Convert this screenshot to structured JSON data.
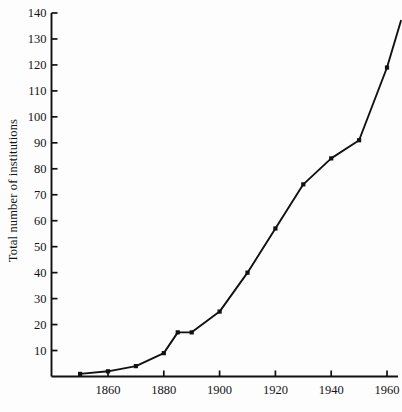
{
  "figure": {
    "background_color": "#fdfdfd",
    "ink_color": "#111111"
  },
  "axes": {
    "ylabel": "Total number of institutions",
    "xlabel": "",
    "y_ticks": [
      10,
      20,
      30,
      40,
      50,
      60,
      70,
      80,
      90,
      100,
      110,
      120,
      130,
      140
    ],
    "y_tick_labels": [
      "10",
      "20",
      "30",
      "40",
      "50",
      "60",
      "70",
      "80",
      "90",
      "100",
      "110",
      "120",
      "130",
      "140"
    ],
    "x_ticks": [
      1860,
      1880,
      1900,
      1920,
      1940,
      1960
    ],
    "x_tick_labels": [
      "1860",
      "1880",
      "1900",
      "1920",
      "1940",
      "1960"
    ]
  },
  "chart_data": {
    "type": "line",
    "title": "",
    "xlabel": "",
    "ylabel": "Total number of institutions",
    "xlim": [
      1847,
      1967
    ],
    "ylim": [
      0,
      140
    ],
    "grid": false,
    "legend": null,
    "marker": "square",
    "line_color": "#111111",
    "marker_color": "#111111",
    "x": [
      1850,
      1860,
      1870,
      1880,
      1885,
      1890,
      1900,
      1910,
      1920,
      1930,
      1940,
      1950,
      1960,
      1965
    ],
    "values": [
      1,
      2,
      4,
      9,
      17,
      17,
      25,
      40,
      57,
      74,
      84,
      91,
      119,
      137
    ],
    "series": [
      {
        "name": "Total number of institutions",
        "x": [
          1850,
          1860,
          1870,
          1880,
          1885,
          1890,
          1900,
          1910,
          1920,
          1930,
          1940,
          1950,
          1960,
          1965
        ],
        "values": [
          1,
          2,
          4,
          9,
          17,
          17,
          25,
          40,
          57,
          74,
          84,
          91,
          119,
          137
        ]
      }
    ]
  }
}
